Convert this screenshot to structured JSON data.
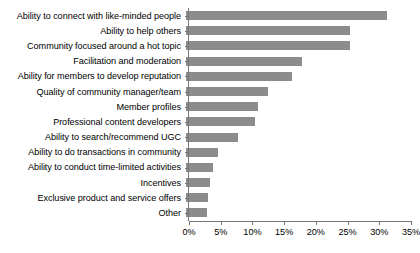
{
  "chart_data": {
    "type": "bar",
    "orientation": "horizontal",
    "title": "",
    "xlabel": "",
    "ylabel": "",
    "xlim": [
      0,
      35
    ],
    "xticks": [
      0,
      5,
      10,
      15,
      20,
      25,
      30,
      35
    ],
    "xtick_labels": [
      "0%",
      "5%",
      "10%",
      "15%",
      "20%",
      "25%",
      "30%",
      "35%"
    ],
    "grid": false,
    "legend": false,
    "bar_color": "#8c8c8c",
    "axis_color": "#767676",
    "value_suffix": "%",
    "categories": [
      "Ability to connect with like-minded people",
      "Ability to help others",
      "Community focused around a hot topic",
      "Facilitation and moderation",
      "Ability for members to develop reputation",
      "Quality of community manager/team",
      "Member profiles",
      "Professional content developers",
      "Ability to search/recommend UGC",
      "Ability to do transactions in community",
      "Ability to conduct time-limited activities",
      "Incentives",
      "Exclusive product and service offers",
      "Other"
    ],
    "values": [
      31.7,
      25.8,
      25.8,
      18.3,
      16.7,
      13.0,
      11.3,
      10.9,
      8.2,
      5.0,
      4.3,
      3.8,
      3.5,
      3.3
    ]
  }
}
